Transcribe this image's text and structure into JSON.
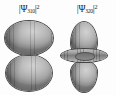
{
  "figure": {
    "title": "",
    "background_color": "#fdfdfd",
    "surface_color": "#a6a6a6",
    "outline_color": "#4b4b4b",
    "label_color": "#1b1b1b"
  },
  "panels": [
    {
      "id": "panel-left",
      "label": {
        "bra": "|",
        "psi": "Ψ",
        "subscript": "310",
        "ket": "|",
        "superscript": "2",
        "plain": "|Ψ₃₁₀|²"
      },
      "orbital": {
        "name": "3p_z probability density",
        "quantum_numbers": {
          "n": 3,
          "l": 1,
          "m": 0
        },
        "shape": "two stacked oblate spheroid lobes",
        "lobe_count": 2,
        "torus_count": 0
      }
    },
    {
      "id": "panel-right",
      "label": {
        "bra": "|",
        "psi": "Ψ",
        "subscript": "320",
        "ket": "|",
        "superscript": "2",
        "plain": "|Ψ₃₂₀|²"
      },
      "orbital": {
        "name": "3d_z2 probability density",
        "quantum_numbers": {
          "n": 3,
          "l": 2,
          "m": 0
        },
        "shape": "two teardrop lobes along z with an equatorial torus",
        "lobe_count": 2,
        "torus_count": 1
      }
    }
  ]
}
